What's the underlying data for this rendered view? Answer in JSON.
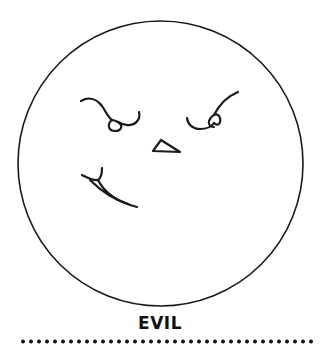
{
  "caption": "EVIL",
  "colors": {
    "background": "#ffffff",
    "stroke": "#1a1a1a",
    "text": "#111111"
  },
  "face": {
    "expression": "evil",
    "circle": {
      "cx": 160.5,
      "cy": 163.5,
      "r": 142.5
    }
  },
  "separator": {
    "style": "dotted",
    "dot_spacing": 8
  }
}
